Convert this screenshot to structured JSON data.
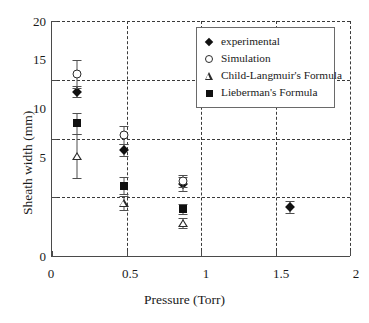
{
  "chart_data": {
    "type": "scatter",
    "title": "",
    "xlabel": "Pressure (Torr)",
    "ylabel": "Sheath width (mm)",
    "xlim": [
      0,
      2
    ],
    "ylim": [
      0,
      20
    ],
    "xticks": [
      "0",
      "0.5",
      "1",
      "1.5",
      "2"
    ],
    "xtick_values": [
      0,
      0.5,
      1,
      1.5,
      2
    ],
    "yticks": [
      "0",
      "5",
      "10",
      "15",
      "20"
    ],
    "ytick_values": [
      0,
      5,
      10,
      15,
      20
    ],
    "grid": "dashed gridlines at both x and y major ticks",
    "legend_position": "top-right inside axes",
    "series": [
      {
        "name": "experimental",
        "marker": "filled-diamond",
        "color": "#111111",
        "points": [
          {
            "x": 0.17,
            "y": 14.0,
            "yerr": 0.5
          },
          {
            "x": 0.48,
            "y": 9.0,
            "yerr": 0.5
          },
          {
            "x": 0.88,
            "y": 6.1,
            "yerr": 0.6
          },
          {
            "x": 1.6,
            "y": 4.2,
            "yerr": 0.5
          }
        ]
      },
      {
        "name": "Simulation",
        "marker": "open-circle",
        "color": "#2b2b2b",
        "points": [
          {
            "x": 0.17,
            "y": 15.5,
            "yerr": 1.2
          },
          {
            "x": 0.48,
            "y": 10.3,
            "yerr": 0.8
          },
          {
            "x": 0.88,
            "y": 6.4,
            "yerr": 0.5
          }
        ]
      },
      {
        "name": "Child-Langmuir's Formula",
        "marker": "open-triangle",
        "color": "#2b2b2b",
        "points": [
          {
            "x": 0.17,
            "y": 8.5,
            "yerr": 1.9
          },
          {
            "x": 0.48,
            "y": 4.5,
            "yerr": 0.6
          },
          {
            "x": 0.88,
            "y": 2.8,
            "yerr": 0.4
          }
        ]
      },
      {
        "name": "Lieberman's Formula",
        "marker": "filled-square",
        "color": "#111111",
        "points": [
          {
            "x": 0.17,
            "y": 11.3,
            "yerr": 0.9
          },
          {
            "x": 0.48,
            "y": 6.0,
            "yerr": 0.7
          },
          {
            "x": 0.88,
            "y": 4.0,
            "yerr": 0.4
          }
        ]
      }
    ]
  },
  "legend": {
    "items": [
      {
        "label": "experimental",
        "marker": "filled-diamond"
      },
      {
        "label": "Simulation",
        "marker": "open-circle"
      },
      {
        "label": "Child-Langmuir's Formula",
        "marker": "open-triangle"
      },
      {
        "label": "Lieberman's Formula",
        "marker": "filled-square"
      }
    ]
  },
  "colors": {
    "axis": "#4a4a4a",
    "grid": "#3a3a3a",
    "marker_fill": "#111111",
    "marker_stroke": "#2b2b2b",
    "background": "#ffffff"
  }
}
